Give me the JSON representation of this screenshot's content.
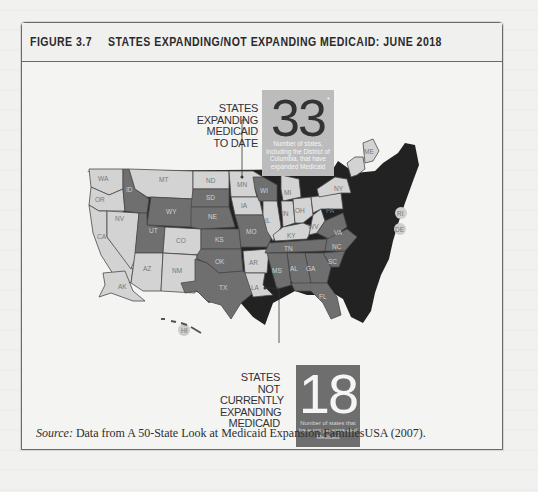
{
  "figure": {
    "number": "FIGURE 3.7",
    "title": "STATES EXPANDING/NOT EXPANDING MEDICAID: JUNE 2018"
  },
  "callouts": {
    "expanding": {
      "label_lines": [
        "STATES",
        "EXPANDING",
        "MEDICAID",
        "TO DATE"
      ],
      "count": "33",
      "asterisk": "*",
      "description": "Number of states, including the District of Columbia, that have expanded Medicaid"
    },
    "not_expanding": {
      "label_lines": [
        "STATES",
        "NOT",
        "CURRENTLY",
        "EXPANDING",
        "MEDICAID"
      ],
      "count": "18",
      "description": "Number of states that have not yet expanded Medicaid"
    }
  },
  "legend_colors": {
    "expanding": "#d3d3d3",
    "not_expanding": "#6f6f6f",
    "border": "#4a4a4a",
    "shadow": "#222222"
  },
  "map_states": {
    "expanding": [
      "WA",
      "OR",
      "CA",
      "NV",
      "AZ",
      "NM",
      "CO",
      "MT",
      "ND",
      "MN",
      "IA",
      "IL",
      "IN",
      "OH",
      "MI",
      "KY",
      "WV",
      "PA",
      "NY",
      "AR",
      "LA",
      "AK",
      "HI",
      "ME",
      "RI",
      "DE"
    ],
    "not_expanding": [
      "ID",
      "WY",
      "UT",
      "SD",
      "NE",
      "KS",
      "OK",
      "TX",
      "MO",
      "WI",
      "TN",
      "MS",
      "AL",
      "GA",
      "SC",
      "NC",
      "VA",
      "FL"
    ]
  },
  "state_labels": {
    "WA": "WA",
    "OR": "OR",
    "CA": "CA",
    "NV": "NV",
    "ID": "ID",
    "MT": "MT",
    "WY": "WY",
    "UT": "UT",
    "CO": "CO",
    "AZ": "AZ",
    "NM": "NM",
    "ND": "ND",
    "SD": "SD",
    "NE": "NE",
    "KS": "KS",
    "OK": "OK",
    "TX": "TX",
    "MN": "MN",
    "IA": "IA",
    "MO": "MO",
    "AR": "AR",
    "LA": "LA",
    "WI": "WI",
    "IL": "IL",
    "MI": "MI",
    "IN": "IN",
    "OH": "OH",
    "KY": "KY",
    "TN": "TN",
    "MS": "MS",
    "AL": "AL",
    "GA": "GA",
    "FL": "FL",
    "SC": "SC",
    "NC": "NC",
    "VA": "VA",
    "WV": "WV",
    "PA": "PA",
    "NY": "NY",
    "ME": "ME",
    "RI": "RI",
    "DE": "DE",
    "AK": "AK",
    "HI": "HI"
  },
  "source": {
    "prefix": "Source:",
    "text": " Data from A 50-State Look at Medicaid Expansion FamiliesUSA (2007)."
  }
}
